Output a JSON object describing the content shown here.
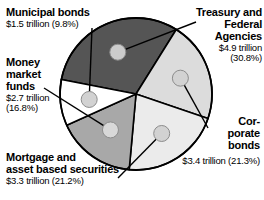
{
  "chart_data": {
    "type": "pie",
    "title": "",
    "unit": "trillion USD",
    "legend_position": "callout-labels",
    "center": {
      "x": 136,
      "y": 94
    },
    "radius": 76,
    "start_angle_deg": -79,
    "slices": [
      {
        "name": "Treasury and Federal Agencies",
        "label_lines": "Treasury and\nFederal\nAgencies",
        "value_text": "$4.9 trillion\n(30.8%)",
        "amount": 4.9,
        "percent": 30.8,
        "color": "#555555",
        "marker_color": "#cccccc"
      },
      {
        "name": "Corporate bonds",
        "label_lines": "Cor-\nporate\nbonds",
        "value_text": "$3.4 trillion (21.3%)",
        "amount": 3.4,
        "percent": 21.3,
        "color": "#dcdcdc",
        "marker_color": "#d2d2d2"
      },
      {
        "name": "Mortgage and asset based securities",
        "label_lines": "Mortgage and\nasset based securities",
        "value_text": "$3.3 trillion (21.2%)",
        "amount": 3.3,
        "percent": 21.2,
        "color": "#ebebeb",
        "marker_color": "#d2d2d2"
      },
      {
        "name": "Money market funds",
        "label_lines": "Money\nmarket\nfunds",
        "value_text": "$2.7 trillion\n(16.8%)",
        "amount": 2.7,
        "percent": 16.8,
        "color": "#a8a8a8",
        "marker_color": "#d8d8d8"
      },
      {
        "name": "Municipal bonds",
        "label_lines": "Municipal bonds",
        "value_text": "$1.5 trillion (9.8%)",
        "amount": 1.5,
        "percent": 9.8,
        "color": "#ffffff",
        "marker_color": "#d2d2d2"
      }
    ],
    "outline_color": "#000000",
    "background": "#ffffff"
  }
}
